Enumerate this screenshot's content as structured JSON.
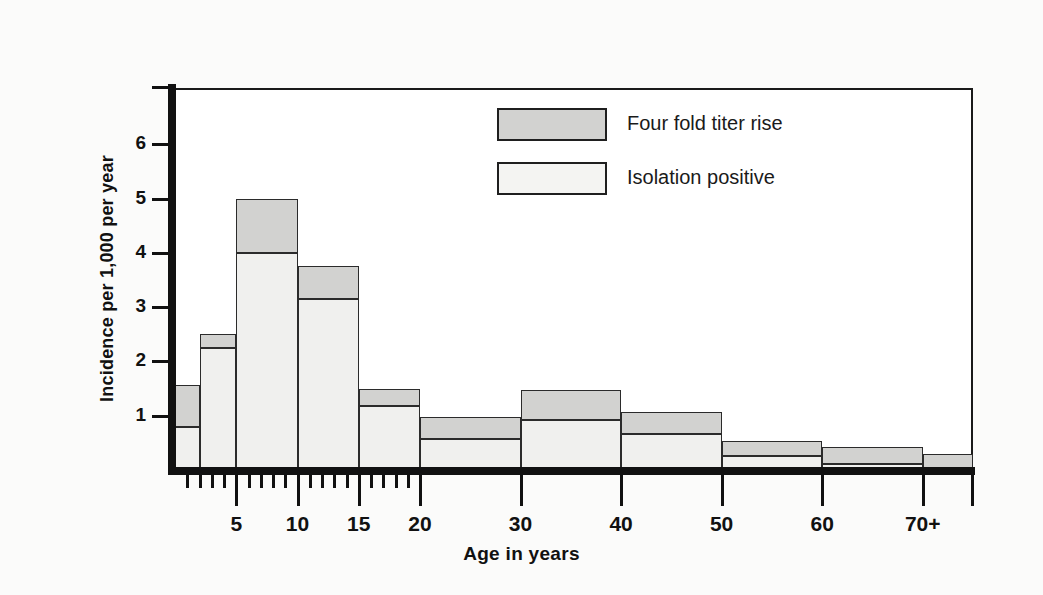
{
  "figure": {
    "background_color": "#fbfbfa",
    "plot_background_color": "#ffffff",
    "axis_color": "#111111"
  },
  "legend": {
    "position": "inside-top-center",
    "entries": [
      {
        "label": "Four fold titer rise",
        "color": "#d2d2d0",
        "key": "fourfold"
      },
      {
        "label": "Isolation positive",
        "color": "#f4f4f2",
        "key": "isolation"
      }
    ]
  },
  "axes": {
    "y": {
      "title": "Incidence per 1,000 per year",
      "tick_labels": [
        "1",
        "2",
        "3",
        "4",
        "5",
        "6"
      ],
      "tick_values": [
        1,
        2,
        3,
        4,
        5,
        6
      ],
      "range": [
        0,
        7.0
      ]
    },
    "x": {
      "title": "Age in years",
      "tick_labels": [
        "5",
        "10",
        "15",
        "20",
        "30",
        "40",
        "50",
        "60",
        "70+"
      ],
      "tick_values": [
        5,
        10,
        15,
        20,
        30,
        40,
        50,
        60,
        70
      ],
      "minor_tick_values": [
        1,
        2,
        3,
        4,
        6,
        7,
        8,
        9,
        11,
        12,
        13,
        14,
        16,
        17,
        18,
        19
      ],
      "range": [
        0,
        75
      ]
    }
  },
  "chart_data": {
    "type": "bar",
    "subtype": "stacked-histogram",
    "title": "",
    "xlabel": "Age in years",
    "ylabel": "Incidence per 1,000 per year",
    "xlim": [
      0,
      75
    ],
    "ylim": [
      0,
      7.0
    ],
    "grid": false,
    "legend_position": "inside-top-center",
    "categories": [
      "0-2",
      "2-5",
      "5-10",
      "10-15",
      "15-20",
      "20-30",
      "30-40",
      "40-50",
      "50-60",
      "60-70",
      "70+"
    ],
    "bin_edges": [
      0,
      2,
      5,
      10,
      15,
      20,
      30,
      40,
      50,
      60,
      70,
      75
    ],
    "series": [
      {
        "name": "Isolation positive",
        "color": "#f0f0ee",
        "values": [
          0.79,
          2.24,
          4.0,
          3.15,
          1.18,
          0.57,
          0.92,
          0.66,
          0.26,
          0.11,
          0.0
        ]
      },
      {
        "name": "Four fold titer rise",
        "color": "#d2d2d0",
        "values": [
          0.78,
          0.26,
          1.0,
          0.6,
          0.32,
          0.41,
          0.56,
          0.41,
          0.27,
          0.31,
          0.3
        ]
      }
    ],
    "totals": [
      1.57,
      2.5,
      5.0,
      3.75,
      1.5,
      0.98,
      1.48,
      1.07,
      0.53,
      0.42,
      0.3
    ]
  }
}
